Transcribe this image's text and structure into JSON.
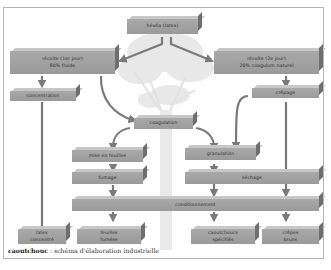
{
  "diagram": {
    "title": "caoutchouc",
    "caption_separator": " : ",
    "caption_text": "schéma d'élaboration industrielle",
    "colors": {
      "box_face": "#a4a4a4",
      "box_top": "#c7c7c7",
      "box_side": "#6e6e6e",
      "arrow": "#7a7a7a",
      "tree": "#e6e6e6",
      "frame": "#b5b5b5"
    },
    "nodes": {
      "hevea": "hévéa (latex)",
      "recolte1": "récolte (1er jour)\n80% fluide",
      "recolte2": "récolte (2e jour)\n20% coagulum naturel",
      "concentration": "concentration",
      "crepage": "crêpage",
      "coagulation": "coagulation",
      "mise_en_feuilles": "mise en feuilles",
      "granulation": "granulation",
      "fumage": "fumage",
      "sechage": "séchage",
      "conditionnement": "conditionnement",
      "latex_concentre": "latex\nconcentré",
      "feuilles_fumees": "feuilles\nfumées",
      "caoutchoucs_specifies": "caoutchoucs\nspécifiés",
      "crepes_bruns": "crêpes\nbruns"
    },
    "edges": [
      [
        "hevea",
        "recolte1"
      ],
      [
        "hevea",
        "recolte2"
      ],
      [
        "recolte1",
        "concentration"
      ],
      [
        "recolte1",
        "coagulation"
      ],
      [
        "recolte2",
        "crepage"
      ],
      [
        "crepage",
        "granulation"
      ],
      [
        "crepage",
        "sechage"
      ],
      [
        "concentration",
        "latex_concentre"
      ],
      [
        "coagulation",
        "mise_en_feuilles"
      ],
      [
        "coagulation",
        "granulation"
      ],
      [
        "mise_en_feuilles",
        "fumage"
      ],
      [
        "fumage",
        "conditionnement"
      ],
      [
        "granulation",
        "sechage"
      ],
      [
        "sechage",
        "conditionnement"
      ],
      [
        "conditionnement",
        "feuilles_fumees"
      ],
      [
        "conditionnement",
        "caoutchoucs_specifies"
      ],
      [
        "conditionnement",
        "crepes_bruns"
      ]
    ]
  }
}
